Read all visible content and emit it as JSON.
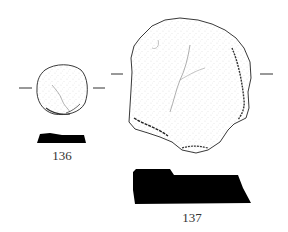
{
  "figure": {
    "type": "archaeological-artifact-drawing",
    "artifacts": [
      {
        "number": "136",
        "plan_view": "small rounded disc, stippled surface",
        "section": "solid black profile"
      },
      {
        "number": "137",
        "plan_view": "large sub-rounded flaked stone, stippled surface with edge hatching",
        "section": "solid black profile"
      }
    ],
    "colors": {
      "background": "#ffffff",
      "ink": "#000000",
      "outline": "#333333"
    }
  }
}
